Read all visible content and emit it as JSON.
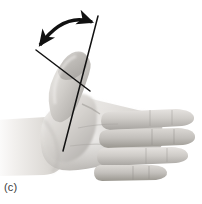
{
  "figure": {
    "panel_label": "(c)",
    "caption_text": "",
    "background_color": "#ffffff",
    "ink_color": "#111111",
    "skin_light": "#e9e7e4",
    "skin_mid": "#c9c6c2",
    "skin_shadow": "#9e9b97",
    "skin_deep": "#807d79"
  },
  "measurement": {
    "type": "goniometry-angle",
    "arc_label": "",
    "angle_degrees": null,
    "arrow_style": "double-headed-curved",
    "reference_line_name": "palm-long-axis",
    "moving_line_name": "thumb-long-axis",
    "vertex": {
      "x": 78,
      "y": 78
    },
    "arc_start": {
      "x": 38,
      "y": 48
    },
    "arc_end": {
      "x": 95,
      "y": 22
    }
  },
  "anatomy": {
    "view": "palmar",
    "hand_side": "right",
    "parts": [
      {
        "name": "forearm",
        "label": "Forearm"
      },
      {
        "name": "wrist",
        "label": "Wrist"
      },
      {
        "name": "palm",
        "label": "Palm"
      },
      {
        "name": "thenar-eminence",
        "label": "Thenar eminence"
      },
      {
        "name": "thumb",
        "label": "Thumb"
      },
      {
        "name": "index-finger",
        "label": "Index finger"
      },
      {
        "name": "middle-finger",
        "label": "Middle finger"
      },
      {
        "name": "ring-finger",
        "label": "Ring finger"
      },
      {
        "name": "little-finger",
        "label": "Little finger"
      }
    ]
  }
}
